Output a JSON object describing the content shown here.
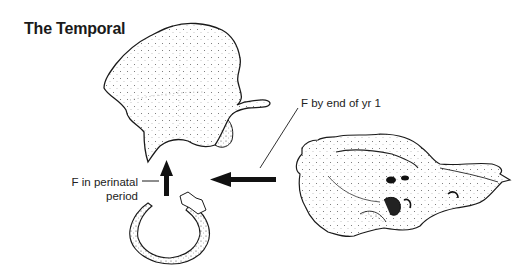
{
  "title": "The Temporal",
  "labels": {
    "fusion_year1": "F by end of yr 1",
    "fusion_perinatal_line1": "F in perinatal",
    "fusion_perinatal_line2": "period"
  },
  "parts": [
    {
      "name": "squamous-part",
      "description": "Squamous portion with zygomatic process"
    },
    {
      "name": "tympanic-ring",
      "description": "Tympanic ring"
    },
    {
      "name": "petromastoid-part",
      "description": "Petromastoid portion"
    }
  ],
  "arrows": [
    {
      "from": "tympanic-ring",
      "to": "squamous-part",
      "direction": "up",
      "label": "F in perinatal period"
    },
    {
      "from": "petromastoid-part",
      "to": "squamous-part",
      "direction": "left",
      "label": "F by end of yr 1"
    }
  ],
  "colors": {
    "ink": "#1a1a1a",
    "background": "#ffffff"
  }
}
